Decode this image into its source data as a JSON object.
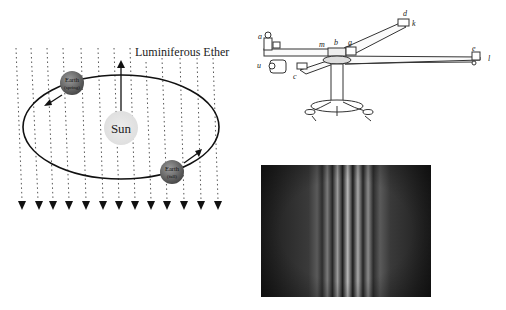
{
  "ether_diagram": {
    "title": "Luminiferous Ether",
    "sun_label": "Sun",
    "earth_spring": {
      "name": "Earth",
      "season": "(spring)"
    },
    "earth_fall": {
      "name": "Earth",
      "season": "(fall)"
    },
    "colors": {
      "sun": "#e6e6e6",
      "earth": "#6a6a6a",
      "orbit": "#111111",
      "ether_lines": "#444444"
    }
  },
  "apparatus": {
    "labels": {
      "a": "a",
      "u": "u",
      "m": "m",
      "b": "b",
      "g": "g",
      "c": "c",
      "d": "d",
      "k": "k",
      "e": "e",
      "l": "l"
    }
  },
  "fringe_image": {
    "description": "interference fringes",
    "colors": {
      "dark": "#1e1e1e",
      "light": "#c8c8c8"
    }
  }
}
